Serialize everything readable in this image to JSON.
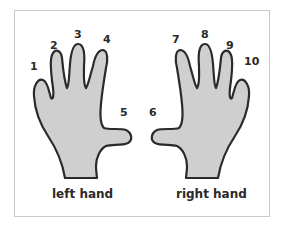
{
  "diagram": {
    "left_hand": {
      "label": "left hand",
      "fingers": [
        "1",
        "2",
        "3",
        "4",
        "5"
      ]
    },
    "right_hand": {
      "label": "right hand",
      "fingers": [
        "6",
        "7",
        "8",
        "9",
        "10"
      ]
    },
    "colors": {
      "hand_fill": "#cfcfcf",
      "outline": "#2a2a2a",
      "frame": "#c8c8c8"
    }
  }
}
